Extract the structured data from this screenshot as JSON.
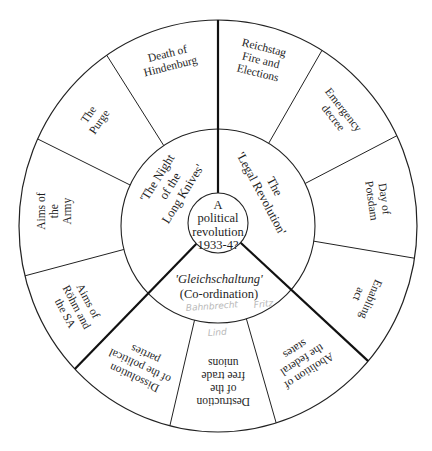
{
  "diagram": {
    "center": {
      "lines": [
        "A",
        "political",
        "revolution",
        "1933-4?"
      ]
    },
    "inner_ring": [
      {
        "id": "night-of-long-knives",
        "lines": [
          "'The Night",
          "of the",
          "Long Knives'"
        ],
        "italic_line": -1
      },
      {
        "id": "legal-revolution",
        "lines": [
          "The",
          "'Legal Revolution'"
        ],
        "italic_line": -1
      },
      {
        "id": "gleichschaltung",
        "lines": [
          "'Gleichschaltung'",
          "(Co-ordination)"
        ],
        "italic_line": 0
      }
    ],
    "outer_ring": [
      {
        "id": "reichstag-fire",
        "group": "legal-revolution",
        "lines": [
          "Reichstag",
          "Fire and",
          "Elections"
        ]
      },
      {
        "id": "emergency-decree",
        "group": "legal-revolution",
        "lines": [
          "Emergency",
          "decree"
        ]
      },
      {
        "id": "day-of-potsdam",
        "group": "legal-revolution",
        "lines": [
          "Day of",
          "Potsdam"
        ]
      },
      {
        "id": "enabling-act",
        "group": "legal-revolution",
        "lines": [
          "Enabling",
          "act"
        ]
      },
      {
        "id": "abolition-federal-states",
        "group": "gleichschaltung",
        "lines": [
          "Abolition of",
          "the federal",
          "states"
        ]
      },
      {
        "id": "destruction-trade-unions",
        "group": "gleichschaltung",
        "lines": [
          "Destruction",
          "of the",
          "free trade",
          "unions"
        ]
      },
      {
        "id": "dissolution-political-parties",
        "group": "gleichschaltung",
        "lines": [
          "Dissolution",
          "of the political",
          "parties"
        ]
      },
      {
        "id": "aims-rohm-sa",
        "group": "night-of-long-knives",
        "lines": [
          "Aims of",
          "Röhm and",
          "the SA"
        ]
      },
      {
        "id": "aims-army",
        "group": "night-of-long-knives",
        "lines": [
          "Aims of",
          "the",
          "Army"
        ]
      },
      {
        "id": "the-purge",
        "group": "night-of-long-knives",
        "lines": [
          "The",
          "Purge"
        ]
      },
      {
        "id": "death-hindenburg",
        "group": "night-of-long-knives",
        "lines": [
          "Death of",
          "Hindenburg"
        ]
      }
    ],
    "pencil_annotations": [
      {
        "text": "Bahnbrecht",
        "x": 186,
        "y": 311,
        "rot": -4
      },
      {
        "text": "Fritz",
        "x": 254,
        "y": 308,
        "rot": -6
      },
      {
        "text": "Lind",
        "x": 208,
        "y": 336,
        "rot": -4
      }
    ],
    "colors": {
      "stroke": "#222222",
      "text": "#1e1e1e",
      "pencil": "#b9b9b9",
      "background": "#ffffff"
    }
  }
}
